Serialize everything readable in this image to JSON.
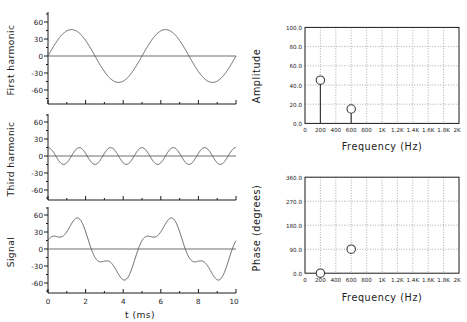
{
  "figure": {
    "background": "#ffffff",
    "line_color": "#555555",
    "axis_color": "#1a1a1a",
    "grid_color": "#999999"
  },
  "chart_data": [
    {
      "type": "line",
      "name": "first-harmonic",
      "title": "",
      "xlabel": "",
      "ylabel": "First harmonic",
      "xlim": [
        0,
        10
      ],
      "ylim": [
        -75,
        75
      ],
      "xticks": [
        0,
        2,
        4,
        6,
        8,
        10
      ],
      "yticks": [
        -60,
        -30,
        0,
        30,
        60
      ],
      "ytick_labels": [
        "-60",
        "-30",
        "0",
        "30",
        "60"
      ],
      "grid": false,
      "zero_line": true,
      "waveform": {
        "amplitude": 45,
        "frequency_hz": 200,
        "phase_deg": 0,
        "form": "sine"
      }
    },
    {
      "type": "line",
      "name": "third-harmonic",
      "title": "",
      "xlabel": "",
      "ylabel": "Third harmonic",
      "xlim": [
        0,
        10
      ],
      "ylim": [
        -75,
        75
      ],
      "xticks": [
        0,
        2,
        4,
        6,
        8,
        10
      ],
      "yticks": [
        -60,
        -30,
        0,
        30,
        60
      ],
      "ytick_labels": [
        "-60",
        "-30",
        "0",
        "30",
        "60"
      ],
      "grid": false,
      "zero_line": true,
      "waveform": {
        "amplitude": 15,
        "frequency_hz": 600,
        "phase_deg": 90,
        "form": "cosine"
      }
    },
    {
      "type": "line",
      "name": "signal",
      "title": "",
      "xlabel": "t  (ms)",
      "ylabel": "Signal",
      "xlim": [
        0,
        10
      ],
      "ylim": [
        -75,
        75
      ],
      "xticks": [
        0,
        2,
        4,
        6,
        8,
        10
      ],
      "xtick_labels": [
        "0",
        "2",
        "4",
        "6",
        "8",
        "10"
      ],
      "yticks": [
        -60,
        -30,
        0,
        30,
        60
      ],
      "ytick_labels": [
        "-60",
        "-30",
        "0",
        "30",
        "60"
      ],
      "grid": false,
      "zero_line": true,
      "components": [
        {
          "amplitude": 45,
          "frequency_hz": 200,
          "phase_deg": 0,
          "form": "sine"
        },
        {
          "amplitude": 15,
          "frequency_hz": 600,
          "phase_deg": 90,
          "form": "cosine"
        }
      ]
    },
    {
      "type": "bar",
      "name": "amplitude-spectrum",
      "title": "",
      "xlabel": "Frequency  (Hz)",
      "ylabel": "Amplitude",
      "xlim": [
        0,
        2000
      ],
      "ylim": [
        0,
        100
      ],
      "xticks": [
        0,
        200,
        400,
        600,
        800,
        1000,
        1200,
        1400,
        1600,
        1800,
        2000
      ],
      "xtick_labels": [
        "0",
        "200",
        "400",
        "600",
        "800",
        "1K",
        "1.2K",
        "1.4K",
        "1.6K",
        "1.8K",
        "2K"
      ],
      "yticks": [
        0,
        20,
        40,
        60,
        80,
        100
      ],
      "ytick_labels": [
        "0.0",
        "20.0",
        "40.0",
        "60.0",
        "80.0",
        "100.0"
      ],
      "grid": true,
      "marker": "open-circle",
      "stems": true,
      "x": [
        200,
        600
      ],
      "values": [
        45,
        15
      ]
    },
    {
      "type": "scatter",
      "name": "phase-spectrum",
      "title": "",
      "xlabel": "Frequency  (Hz)",
      "ylabel": "Phase  (degrees)",
      "xlim": [
        0,
        2000
      ],
      "ylim": [
        0,
        360
      ],
      "xticks": [
        0,
        200,
        400,
        600,
        800,
        1000,
        1200,
        1400,
        1600,
        1800,
        2000
      ],
      "xtick_labels": [
        "0",
        "200",
        "400",
        "600",
        "800",
        "1K",
        "1.2K",
        "1.4K",
        "1.6K",
        "1.8K",
        "2K"
      ],
      "yticks": [
        0,
        90,
        180,
        270,
        360
      ],
      "ytick_labels": [
        "0.0",
        "90.0",
        "180.0",
        "270.0",
        "360.0"
      ],
      "grid": true,
      "marker": "open-circle",
      "stems": false,
      "x": [
        200,
        600
      ],
      "values": [
        0,
        90
      ]
    }
  ]
}
